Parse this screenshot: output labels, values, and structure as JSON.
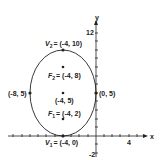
{
  "diagram": {
    "type": "ellipse",
    "axes": {
      "x_label": "x",
      "y_label": "y",
      "y_tick_top": "12",
      "y_tick_bottom": "-2",
      "x_tick_right": "4"
    },
    "ellipse": {
      "center": "(-4, 5)",
      "vertex_top": {
        "name": "V",
        "sub": "2",
        "value": "= (-4, 10)"
      },
      "vertex_bottom": {
        "name": "V",
        "sub": "1",
        "value": "= (-4, 0)"
      },
      "focus_top": {
        "name": "F",
        "sub": "2",
        "value": "= (-4, 8)"
      },
      "focus_bottom": {
        "name": "F",
        "sub": "1",
        "value": "= (-4, 2)"
      },
      "minor_left": "(-8, 5)",
      "minor_right": "(0, 5)"
    },
    "colors": {
      "stroke": "#222222",
      "background": "#ffffff"
    }
  }
}
